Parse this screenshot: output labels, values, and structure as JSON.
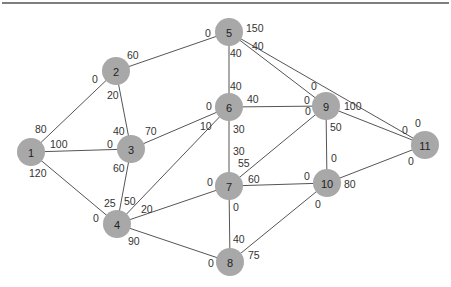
{
  "diagram": {
    "type": "network-graph",
    "top_rule_color": "#555555",
    "node_color": "#a8a8a8",
    "nodes": [
      {
        "id": "1",
        "x": 31,
        "y": 152
      },
      {
        "id": "2",
        "x": 116,
        "y": 71
      },
      {
        "id": "3",
        "x": 131,
        "y": 149
      },
      {
        "id": "4",
        "x": 117,
        "y": 224
      },
      {
        "id": "5",
        "x": 229,
        "y": 32
      },
      {
        "id": "6",
        "x": 229,
        "y": 107
      },
      {
        "id": "7",
        "x": 229,
        "y": 186
      },
      {
        "id": "8",
        "x": 230,
        "y": 262
      },
      {
        "id": "9",
        "x": 326,
        "y": 106
      },
      {
        "id": "10",
        "x": 327,
        "y": 183
      },
      {
        "id": "11",
        "x": 425,
        "y": 145
      }
    ],
    "edges": [
      {
        "from": "1",
        "to": "2"
      },
      {
        "from": "1",
        "to": "3"
      },
      {
        "from": "1",
        "to": "4"
      },
      {
        "from": "2",
        "to": "3"
      },
      {
        "from": "2",
        "to": "5"
      },
      {
        "from": "3",
        "to": "4"
      },
      {
        "from": "3",
        "to": "6"
      },
      {
        "from": "4",
        "to": "6"
      },
      {
        "from": "4",
        "to": "7"
      },
      {
        "from": "4",
        "to": "8"
      },
      {
        "from": "5",
        "to": "6"
      },
      {
        "from": "5",
        "to": "9"
      },
      {
        "from": "5",
        "to": "11"
      },
      {
        "from": "6",
        "to": "7"
      },
      {
        "from": "6",
        "to": "9"
      },
      {
        "from": "7",
        "to": "8"
      },
      {
        "from": "7",
        "to": "9"
      },
      {
        "from": "7",
        "to": "10"
      },
      {
        "from": "8",
        "to": "10"
      },
      {
        "from": "9",
        "to": "10"
      },
      {
        "from": "9",
        "to": "11"
      },
      {
        "from": "10",
        "to": "11"
      }
    ],
    "labels": [
      {
        "text": "80",
        "x": 35,
        "y": 133
      },
      {
        "text": "0",
        "x": 92,
        "y": 83
      },
      {
        "text": "100",
        "x": 50,
        "y": 148
      },
      {
        "text": "0",
        "x": 107,
        "y": 148
      },
      {
        "text": "120",
        "x": 29,
        "y": 177
      },
      {
        "text": "0",
        "x": 93,
        "y": 222
      },
      {
        "text": "60",
        "x": 127,
        "y": 59
      },
      {
        "text": "0",
        "x": 205,
        "y": 37
      },
      {
        "text": "20",
        "x": 107,
        "y": 99
      },
      {
        "text": "40",
        "x": 113,
        "y": 135
      },
      {
        "text": "70",
        "x": 145,
        "y": 135
      },
      {
        "text": "0",
        "x": 206,
        "y": 110
      },
      {
        "text": "60",
        "x": 113,
        "y": 172
      },
      {
        "text": "25",
        "x": 104,
        "y": 207
      },
      {
        "text": "50",
        "x": 124,
        "y": 205
      },
      {
        "text": "10",
        "x": 200,
        "y": 130
      },
      {
        "text": "20",
        "x": 141,
        "y": 213
      },
      {
        "text": "0",
        "x": 207,
        "y": 186
      },
      {
        "text": "90",
        "x": 128,
        "y": 245
      },
      {
        "text": "0",
        "x": 208,
        "y": 267
      },
      {
        "text": "150",
        "x": 246,
        "y": 32
      },
      {
        "text": "40",
        "x": 230,
        "y": 57
      },
      {
        "text": "40",
        "x": 230,
        "y": 90
      },
      {
        "text": "40",
        "x": 252,
        "y": 50
      },
      {
        "text": "0",
        "x": 311,
        "y": 90
      },
      {
        "text": "0",
        "x": 415,
        "y": 127
      },
      {
        "text": "0",
        "x": 402,
        "y": 134
      },
      {
        "text": "40",
        "x": 247,
        "y": 103
      },
      {
        "text": "0",
        "x": 304,
        "y": 104
      },
      {
        "text": "30",
        "x": 233,
        "y": 133
      },
      {
        "text": "30",
        "x": 233,
        "y": 155
      },
      {
        "text": "55",
        "x": 238,
        "y": 167
      },
      {
        "text": "0",
        "x": 305,
        "y": 115
      },
      {
        "text": "0",
        "x": 233,
        "y": 211
      },
      {
        "text": "40",
        "x": 233,
        "y": 243
      },
      {
        "text": "60",
        "x": 248,
        "y": 183
      },
      {
        "text": "0",
        "x": 304,
        "y": 180
      },
      {
        "text": "75",
        "x": 248,
        "y": 259
      },
      {
        "text": "0",
        "x": 315,
        "y": 208
      },
      {
        "text": "50",
        "x": 330,
        "y": 131
      },
      {
        "text": "0",
        "x": 331,
        "y": 162
      },
      {
        "text": "100",
        "x": 344,
        "y": 110
      },
      {
        "text": "80",
        "x": 344,
        "y": 188
      },
      {
        "text": "0",
        "x": 408,
        "y": 165
      }
    ]
  }
}
